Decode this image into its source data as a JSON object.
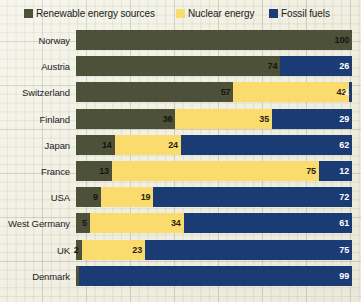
{
  "legend": {
    "items": [
      {
        "label": "Renewable energy sources",
        "key": "renewable",
        "color": "#4e5139",
        "swatch_name": "legend-swatch-renewable"
      },
      {
        "label": "Nuclear energy",
        "key": "nuclear",
        "color": "#fadc6e",
        "swatch_name": "legend-swatch-nuclear"
      },
      {
        "label": "Fossil fuels",
        "key": "fossil",
        "color": "#1b3b75",
        "swatch_name": "legend-swatch-fossil"
      }
    ]
  },
  "chart_data": {
    "type": "bar",
    "orientation": "horizontal",
    "stacked": true,
    "title": "",
    "subtitle": "",
    "xlabel": "",
    "ylabel": "",
    "xlim": [
      0,
      100
    ],
    "grid": true,
    "legend_position": "top",
    "units": "percent",
    "categories": [
      "Norway",
      "Austria",
      "Switzerland",
      "Finland",
      "Japan",
      "France",
      "USA",
      "West Germany",
      "UK",
      "Denmark"
    ],
    "series": [
      {
        "name": "Renewable energy sources",
        "color": "#4e5139",
        "values": [
          100,
          74,
          57,
          36,
          14,
          13,
          9,
          5,
          2,
          1
        ]
      },
      {
        "name": "Nuclear energy",
        "color": "#fadc6e",
        "values": [
          0,
          0,
          42,
          35,
          24,
          75,
          19,
          34,
          23,
          0
        ]
      },
      {
        "name": "Fossil fuels",
        "color": "#1b3b75",
        "values": [
          0,
          26,
          1,
          29,
          62,
          12,
          72,
          61,
          75,
          99
        ]
      }
    ],
    "rows": [
      {
        "category": "Norway",
        "renewable": 100,
        "nuclear": 0,
        "fossil": 0,
        "labels": {
          "renewable": "100",
          "nuclear": "",
          "fossil": ""
        }
      },
      {
        "category": "Austria",
        "renewable": 74,
        "nuclear": 0,
        "fossil": 26,
        "labels": {
          "renewable": "74",
          "nuclear": "",
          "fossil": "26"
        }
      },
      {
        "category": "Switzerland",
        "renewable": 57,
        "nuclear": 42,
        "fossil": 1,
        "labels": {
          "renewable": "57",
          "nuclear": "42",
          "fossil": "1"
        }
      },
      {
        "category": "Finland",
        "renewable": 36,
        "nuclear": 35,
        "fossil": 29,
        "labels": {
          "renewable": "36",
          "nuclear": "35",
          "fossil": "29"
        }
      },
      {
        "category": "Japan",
        "renewable": 14,
        "nuclear": 24,
        "fossil": 62,
        "labels": {
          "renewable": "14",
          "nuclear": "24",
          "fossil": "62"
        }
      },
      {
        "category": "France",
        "renewable": 13,
        "nuclear": 75,
        "fossil": 12,
        "labels": {
          "renewable": "13",
          "nuclear": "75",
          "fossil": "12"
        }
      },
      {
        "category": "USA",
        "renewable": 9,
        "nuclear": 19,
        "fossil": 72,
        "labels": {
          "renewable": "9",
          "nuclear": "19",
          "fossil": "72"
        }
      },
      {
        "category": "West Germany",
        "renewable": 5,
        "nuclear": 34,
        "fossil": 61,
        "labels": {
          "renewable": "5",
          "nuclear": "34",
          "fossil": "61"
        }
      },
      {
        "category": "UK",
        "renewable": 2,
        "nuclear": 23,
        "fossil": 75,
        "labels": {
          "renewable": "2",
          "nuclear": "23",
          "fossil": "75"
        }
      },
      {
        "category": "Denmark",
        "renewable": 1,
        "nuclear": 0,
        "fossil": 99,
        "labels": {
          "renewable": "",
          "nuclear": "",
          "fossil": "99"
        }
      }
    ]
  },
  "colors": {
    "renewable": "#4e5139",
    "nuclear": "#fadc6e",
    "fossil": "#1b3b75",
    "paper": "#f3f2e5",
    "grid": "#96a08c",
    "text": "#23231e"
  }
}
